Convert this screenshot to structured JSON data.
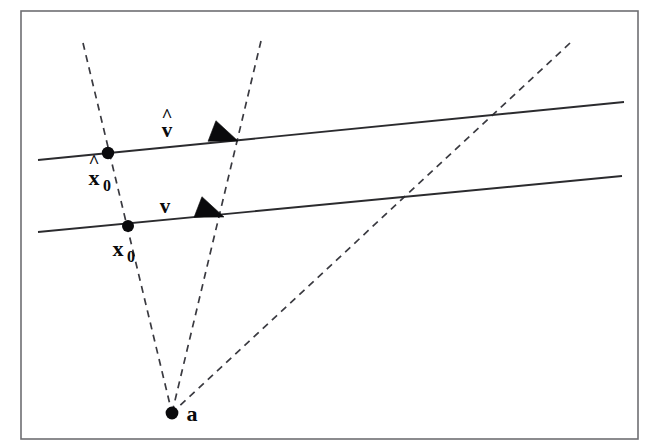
{
  "figure": {
    "kind": "geometric-diagram",
    "background_color": "#ffffff",
    "frame": {
      "stroke_color": "#6e6e72",
      "x": 21,
      "y": 11,
      "width": 617,
      "height": 428
    }
  },
  "colors": {
    "ink": "#0a0a0c",
    "solid_stroke": "#2b2b2e",
    "dashed_stroke": "#3a3a40",
    "frame": "#6e6e72",
    "background": "#ffffff"
  },
  "solid_lines": [
    {
      "id": "upper-line",
      "x1": 38,
      "y1": 160,
      "x2": 624,
      "y2": 102
    },
    {
      "id": "lower-line",
      "x1": 38,
      "y1": 232,
      "x2": 622,
      "y2": 176
    }
  ],
  "dashed_lines": [
    {
      "id": "dashed-left",
      "x1": 83,
      "y1": 43,
      "x2": 172,
      "y2": 413
    },
    {
      "id": "dashed-middle",
      "x1": 261,
      "y1": 41,
      "x2": 172,
      "y2": 413
    },
    {
      "id": "dashed-right",
      "x1": 570,
      "y1": 43,
      "x2": 172,
      "y2": 413
    }
  ],
  "points": [
    {
      "id": "x-hat-zero",
      "label": "x",
      "hat": "^",
      "subscript": "0",
      "cx": 108,
      "cy": 153,
      "r": 6.2,
      "label_x": 84,
      "label_y": 184
    },
    {
      "id": "x-zero",
      "label": "x",
      "hat": "",
      "subscript": "0",
      "cx": 128,
      "cy": 226,
      "r": 6.0,
      "label_x": 108,
      "label_y": 256
    },
    {
      "id": "apex-a",
      "label": "a",
      "hat": "",
      "subscript": "",
      "cx": 172,
      "cy": 413,
      "r": 6.4,
      "label_x": 186,
      "label_y": 421
    }
  ],
  "vectors": [
    {
      "id": "v-hat",
      "label": "v",
      "hat": "^",
      "label_x": 162,
      "label_y": 135,
      "arrow_tip_x": 238,
      "arrow_tip_y": 141,
      "arrow_back_x": 212,
      "arrow_back_y": 131,
      "arrow_size": 11
    },
    {
      "id": "v",
      "label": "v",
      "hat": "",
      "label_x": 160,
      "label_y": 212,
      "arrow_tip_x": 224,
      "arrow_tip_y": 217,
      "arrow_back_x": 198,
      "arrow_back_y": 207,
      "arrow_size": 11
    }
  ],
  "annotations": {
    "description": "Two parallel straight lines each carrying a direction vector; three dashed rays fan out from a common apex point labelled a at the bottom, intersecting the lines at the marked base points."
  }
}
